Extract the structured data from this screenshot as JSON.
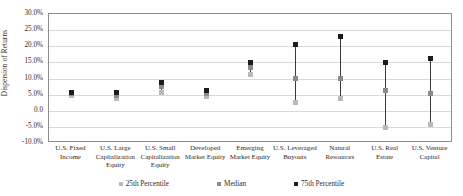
{
  "chart_data": {
    "type": "scatter",
    "title": "",
    "xlabel": "",
    "ylabel": "Dispersion of Returns",
    "ylim": [
      -10,
      30
    ],
    "ytick_step": 5,
    "grid": true,
    "legend_position": "bottom",
    "ytick_labels": [
      "30.0%",
      "25.0%",
      "20.0%",
      "15.0%",
      "10.0%",
      "5.0%",
      "0.0",
      "-5.0%",
      "-10.0%"
    ],
    "ytick_values": [
      30,
      25,
      20,
      15,
      10,
      5,
      0,
      -5,
      -10
    ],
    "categories": [
      "U.S. Fixed Income",
      "U.S. Large Capitalization Equity",
      "U.S. Small Capitalization Equity",
      "Developed Market Equity",
      "Emerging Market Equity",
      "U.S. Leveraged Buyouts",
      "Natural Resources",
      "U.S. Real Estate",
      "U.S. Venture Capital"
    ],
    "series": [
      {
        "name": "25th Percentile",
        "color": "#b9b9b9",
        "values": [
          4.6,
          3.9,
          5.8,
          4.4,
          11.2,
          2.7,
          3.7,
          -5.2,
          -4.3
        ]
      },
      {
        "name": "Median",
        "color": "#8a8a8a",
        "values": [
          5.2,
          4.8,
          7.4,
          5.4,
          13.4,
          9.9,
          10.1,
          6.4,
          5.2
        ]
      },
      {
        "name": "75th Percentile",
        "color": "#1c1c1c",
        "values": [
          5.6,
          5.6,
          8.8,
          6.3,
          14.9,
          20.4,
          22.9,
          14.9,
          16.3
        ]
      }
    ],
    "legend": [
      {
        "label": "25th Percentile",
        "color": "#b9b9b9"
      },
      {
        "label": "Median",
        "color": "#8a8a8a"
      },
      {
        "label": "75th Percentile",
        "color": "#1c1c1c"
      }
    ]
  }
}
